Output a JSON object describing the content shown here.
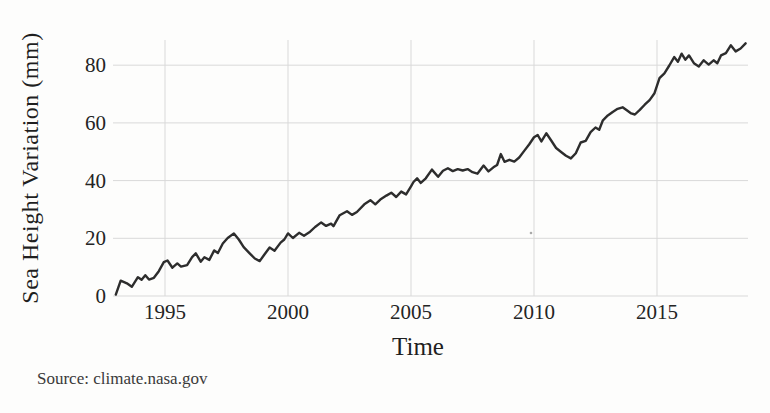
{
  "figure": {
    "y_axis_label": "Sea Height Variation (mm)",
    "x_axis_label": "Time",
    "source_note": "Source: climate.nasa.gov"
  },
  "colors": {
    "line": "#2d2d2d",
    "grid": "#d9d9d9",
    "tick_text": "#242424",
    "label_text": "#1f1f1f",
    "source_text": "#3a3a3a",
    "background": "#fdfdfc"
  },
  "chart_data": {
    "type": "line",
    "title": "",
    "xlabel": "Time",
    "ylabel": "Sea Height Variation (mm)",
    "source": "Source: climate.nasa.gov",
    "x_ticks": [
      1995,
      2000,
      2005,
      2010,
      2015
    ],
    "y_ticks": [
      0,
      20,
      40,
      60,
      80
    ],
    "xlim": [
      1993,
      2018.7
    ],
    "ylim": [
      0,
      88.6
    ],
    "grid": true,
    "legend": "none",
    "series": [
      {
        "name": "Sea Height Variation (mm)",
        "points": [
          [
            1993.0,
            0.5
          ],
          [
            1993.2,
            5.3
          ],
          [
            1993.45,
            4.4
          ],
          [
            1993.65,
            3.2
          ],
          [
            1993.9,
            6.5
          ],
          [
            1994.05,
            5.6
          ],
          [
            1994.2,
            7.2
          ],
          [
            1994.35,
            5.7
          ],
          [
            1994.55,
            6.3
          ],
          [
            1994.75,
            8.6
          ],
          [
            1994.95,
            11.7
          ],
          [
            1995.1,
            12.3
          ],
          [
            1995.3,
            9.8
          ],
          [
            1995.5,
            11.3
          ],
          [
            1995.65,
            10.2
          ],
          [
            1995.9,
            10.7
          ],
          [
            1996.1,
            13.5
          ],
          [
            1996.25,
            14.8
          ],
          [
            1996.45,
            11.9
          ],
          [
            1996.6,
            13.4
          ],
          [
            1996.8,
            12.5
          ],
          [
            1997.0,
            15.8
          ],
          [
            1997.15,
            14.9
          ],
          [
            1997.35,
            18.2
          ],
          [
            1997.55,
            20.1
          ],
          [
            1997.8,
            21.7
          ],
          [
            1998.0,
            19.6
          ],
          [
            1998.2,
            16.9
          ],
          [
            1998.45,
            14.7
          ],
          [
            1998.65,
            13.0
          ],
          [
            1998.85,
            12.1
          ],
          [
            1999.05,
            14.5
          ],
          [
            1999.25,
            16.8
          ],
          [
            1999.45,
            15.7
          ],
          [
            1999.7,
            18.5
          ],
          [
            1999.85,
            19.6
          ],
          [
            2000.0,
            21.7
          ],
          [
            2000.2,
            20.1
          ],
          [
            2000.45,
            21.9
          ],
          [
            2000.65,
            20.9
          ],
          [
            2000.9,
            22.3
          ],
          [
            2001.1,
            23.9
          ],
          [
            2001.35,
            25.5
          ],
          [
            2001.55,
            24.3
          ],
          [
            2001.75,
            25.1
          ],
          [
            2001.85,
            24.2
          ],
          [
            2002.1,
            28.0
          ],
          [
            2002.4,
            29.4
          ],
          [
            2002.6,
            28.1
          ],
          [
            2002.8,
            29.1
          ],
          [
            2003.1,
            31.8
          ],
          [
            2003.35,
            33.2
          ],
          [
            2003.55,
            31.8
          ],
          [
            2003.75,
            33.4
          ],
          [
            2004.0,
            34.8
          ],
          [
            2004.2,
            35.8
          ],
          [
            2004.4,
            34.3
          ],
          [
            2004.6,
            36.2
          ],
          [
            2004.8,
            35.2
          ],
          [
            2005.0,
            38.0
          ],
          [
            2005.1,
            39.5
          ],
          [
            2005.25,
            40.8
          ],
          [
            2005.4,
            39.2
          ],
          [
            2005.6,
            40.8
          ],
          [
            2005.85,
            43.8
          ],
          [
            2006.1,
            41.3
          ],
          [
            2006.3,
            43.4
          ],
          [
            2006.5,
            44.3
          ],
          [
            2006.7,
            43.3
          ],
          [
            2006.9,
            44.0
          ],
          [
            2007.1,
            43.5
          ],
          [
            2007.3,
            44.0
          ],
          [
            2007.5,
            42.9
          ],
          [
            2007.7,
            42.4
          ],
          [
            2007.95,
            45.2
          ],
          [
            2008.15,
            43.2
          ],
          [
            2008.35,
            44.6
          ],
          [
            2008.5,
            45.4
          ],
          [
            2008.65,
            49.2
          ],
          [
            2008.8,
            46.5
          ],
          [
            2009.0,
            47.2
          ],
          [
            2009.2,
            46.6
          ],
          [
            2009.4,
            48.0
          ],
          [
            2009.6,
            50.3
          ],
          [
            2009.8,
            52.5
          ],
          [
            2010.0,
            55.0
          ],
          [
            2010.15,
            55.8
          ],
          [
            2010.3,
            53.6
          ],
          [
            2010.5,
            56.4
          ],
          [
            2010.7,
            53.9
          ],
          [
            2010.9,
            51.3
          ],
          [
            2011.1,
            49.9
          ],
          [
            2011.3,
            48.6
          ],
          [
            2011.5,
            47.7
          ],
          [
            2011.7,
            49.5
          ],
          [
            2011.9,
            53.2
          ],
          [
            2012.1,
            53.8
          ],
          [
            2012.3,
            56.8
          ],
          [
            2012.5,
            58.4
          ],
          [
            2012.65,
            57.6
          ],
          [
            2012.8,
            60.9
          ],
          [
            2013.0,
            62.6
          ],
          [
            2013.2,
            63.8
          ],
          [
            2013.4,
            64.9
          ],
          [
            2013.6,
            65.4
          ],
          [
            2013.8,
            64.2
          ],
          [
            2013.95,
            63.3
          ],
          [
            2014.1,
            62.9
          ],
          [
            2014.3,
            64.5
          ],
          [
            2014.5,
            66.3
          ],
          [
            2014.7,
            67.9
          ],
          [
            2014.9,
            70.3
          ],
          [
            2015.1,
            75.5
          ],
          [
            2015.3,
            77.2
          ],
          [
            2015.5,
            79.9
          ],
          [
            2015.7,
            82.8
          ],
          [
            2015.85,
            81.2
          ],
          [
            2016.0,
            84.0
          ],
          [
            2016.15,
            81.9
          ],
          [
            2016.3,
            83.4
          ],
          [
            2016.5,
            80.7
          ],
          [
            2016.7,
            79.6
          ],
          [
            2016.9,
            81.7
          ],
          [
            2017.1,
            80.2
          ],
          [
            2017.3,
            81.7
          ],
          [
            2017.45,
            80.7
          ],
          [
            2017.6,
            83.4
          ],
          [
            2017.8,
            84.2
          ],
          [
            2018.0,
            86.9
          ],
          [
            2018.2,
            84.8
          ],
          [
            2018.4,
            85.8
          ],
          [
            2018.6,
            87.6
          ]
        ]
      }
    ]
  }
}
